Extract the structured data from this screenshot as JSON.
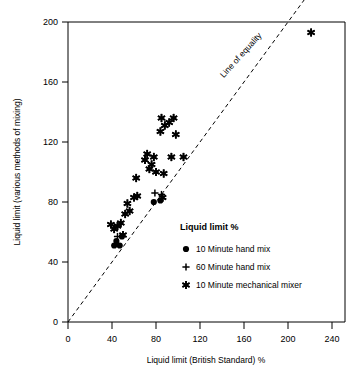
{
  "chart_data": {
    "type": "scatter",
    "title": "",
    "xlabel": "Liquid limit (British Standard) %",
    "ylabel": "Liquid limit (various methods of mixing)",
    "xlim": [
      0,
      250
    ],
    "ylim": [
      0,
      210
    ],
    "xticks": [
      0,
      40,
      80,
      120,
      160,
      200,
      240
    ],
    "yticks": [
      0,
      40,
      80,
      120,
      160,
      200
    ],
    "grid": false,
    "legend_position": "inside-lower-right",
    "annotations": [
      {
        "text": "Line of equality",
        "x": 150,
        "y": 163,
        "rotation": -45
      }
    ],
    "reference_line": {
      "name": "line of equality",
      "style": "dashed",
      "from": [
        0,
        0
      ],
      "to": [
        240,
        240
      ]
    },
    "series": [
      {
        "name": "10 Minute hand mix",
        "marker": "filled-circle",
        "color": "#000000",
        "points": [
          [
            42,
            51
          ],
          [
            47,
            51
          ],
          [
            78,
            80
          ],
          [
            84,
            81
          ],
          [
            44,
            54
          ],
          [
            49,
            57
          ]
        ]
      },
      {
        "name": "60 Minute hand mix",
        "marker": "plus",
        "color": "#000000",
        "points": [
          [
            45,
            57
          ],
          [
            79,
            86
          ],
          [
            85,
            85
          ]
        ]
      },
      {
        "name": "10 Minute mechanical mixer",
        "marker": "asterisk",
        "color": "#000000",
        "points": [
          [
            39,
            65
          ],
          [
            42,
            62
          ],
          [
            45,
            64
          ],
          [
            48,
            66
          ],
          [
            50,
            58
          ],
          [
            52,
            72
          ],
          [
            54,
            79
          ],
          [
            56,
            74
          ],
          [
            60,
            83
          ],
          [
            63,
            84
          ],
          [
            62,
            96
          ],
          [
            70,
            108
          ],
          [
            72,
            112
          ],
          [
            74,
            102
          ],
          [
            76,
            105
          ],
          [
            78,
            110
          ],
          [
            80,
            100
          ],
          [
            84,
            127
          ],
          [
            85,
            136
          ],
          [
            86,
            83
          ],
          [
            87,
            99
          ],
          [
            88,
            131
          ],
          [
            92,
            133
          ],
          [
            94,
            110
          ],
          [
            96,
            136
          ],
          [
            98,
            125
          ],
          [
            105,
            110
          ],
          [
            221,
            193
          ]
        ]
      }
    ]
  },
  "legend": {
    "title": "Liquid limit %",
    "entries": [
      {
        "marker": "filled-circle",
        "label": "10 Minute hand mix"
      },
      {
        "marker": "plus",
        "label": "60 Minute hand mix"
      },
      {
        "marker": "asterisk",
        "label": "10 Minute mechanical mixer"
      }
    ]
  },
  "axes": {
    "x_title": "Liquid limit (British Standard) %",
    "y_title": "Liquid limit (various methods of mixing)",
    "x_tick_labels": [
      "0",
      "40",
      "80",
      "120",
      "160",
      "200",
      "240"
    ],
    "y_tick_labels": [
      "0",
      "40",
      "80",
      "120",
      "160",
      "200"
    ]
  },
  "annotation": {
    "line_of_equality": "Line of equality"
  }
}
